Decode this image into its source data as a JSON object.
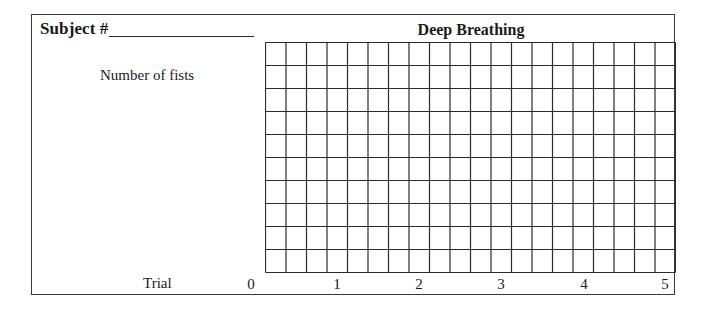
{
  "form": {
    "subject_label": "Subject #",
    "subject_value": ""
  },
  "chart": {
    "title": "Deep Breathing",
    "ylabel": "Number of fists",
    "xlabel": "Trial",
    "x_ticks": [
      "0",
      "1",
      "2",
      "3",
      "4",
      "5"
    ]
  },
  "chart_data": {
    "type": "line",
    "title": "Deep Breathing",
    "xlabel": "Trial",
    "ylabel": "Number of fists",
    "x": [
      0,
      1,
      2,
      3,
      4,
      5
    ],
    "x_ticks": [
      "0",
      "1",
      "2",
      "3",
      "4",
      "5"
    ],
    "series": [],
    "grid": {
      "on": true,
      "columns": 20,
      "rows": 10
    },
    "xlim": [
      0,
      5
    ],
    "note": "Blank graph grid for recording data; no data points plotted."
  }
}
